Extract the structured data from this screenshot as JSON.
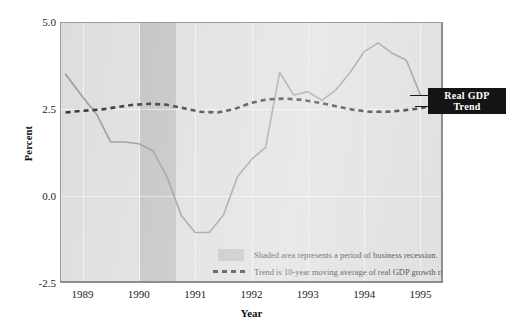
{
  "chart_data": {
    "type": "line",
    "title": "",
    "xlabel": "Year",
    "ylabel": "Percent",
    "xlim": [
      1988.6,
      1995.4
    ],
    "ylim": [
      -2.5,
      5.0
    ],
    "yticks": [
      "5.0",
      "2.5",
      "0.0",
      "-2.5"
    ],
    "ytick_values": [
      5.0,
      2.5,
      0.0,
      -2.5
    ],
    "xticks": [
      "1989",
      "1990",
      "1991",
      "1992",
      "1993",
      "1994",
      "1995"
    ],
    "xtick_values": [
      1989,
      1990,
      1991,
      1992,
      1993,
      1994,
      1995
    ],
    "grid": true,
    "legend_position": "inside-bottom-center",
    "series": [
      {
        "name": "Real GDP",
        "style": "solid",
        "color": "#8c8c8c",
        "x": [
          1988.7,
          1989.0,
          1989.25,
          1989.5,
          1989.75,
          1990.0,
          1990.25,
          1990.5,
          1990.75,
          1991.0,
          1991.25,
          1991.5,
          1991.75,
          1992.0,
          1992.25,
          1992.5,
          1992.75,
          1993.0,
          1993.25,
          1993.5,
          1993.75,
          1994.0,
          1994.25,
          1994.5,
          1994.75,
          1995.0
        ],
        "y": [
          3.5,
          2.85,
          2.35,
          1.55,
          1.55,
          1.5,
          1.3,
          0.55,
          -0.55,
          -1.05,
          -1.05,
          -0.55,
          0.55,
          1.05,
          1.4,
          3.55,
          2.9,
          3.0,
          2.75,
          3.05,
          3.55,
          4.15,
          4.4,
          4.1,
          3.9,
          2.9
        ]
      },
      {
        "name": "Trend",
        "style": "dashed",
        "color": "#1a1a1a",
        "description": "10-year moving average of real GDP growth rate",
        "x": [
          1988.7,
          1989.0,
          1989.3,
          1989.6,
          1989.9,
          1990.2,
          1990.5,
          1990.8,
          1991.1,
          1991.4,
          1991.7,
          1992.0,
          1992.3,
          1992.6,
          1992.9,
          1993.2,
          1993.5,
          1993.8,
          1994.1,
          1994.4,
          1994.7,
          1995.0,
          1995.15
        ],
        "y": [
          2.4,
          2.45,
          2.48,
          2.55,
          2.62,
          2.65,
          2.62,
          2.52,
          2.42,
          2.4,
          2.5,
          2.68,
          2.78,
          2.8,
          2.76,
          2.68,
          2.58,
          2.48,
          2.42,
          2.42,
          2.46,
          2.52,
          2.58
        ]
      }
    ],
    "shaded_regions": [
      {
        "label": "business recession",
        "x_start": 1990.02,
        "x_end": 1990.66,
        "color": "#b9b9b9"
      }
    ],
    "annotations": [
      {
        "name": "real-gdp-callout",
        "text": "Real GDP",
        "at_x": 1995.0,
        "at_y": 2.9
      },
      {
        "name": "trend-callout",
        "text": "Trend",
        "at_x": 1995.15,
        "at_y": 2.58
      }
    ]
  },
  "axes": {
    "y_title": "Percent",
    "x_title": "Year",
    "y_ticks": [
      {
        "label": "5.0"
      },
      {
        "label": "2.5"
      },
      {
        "label": "0.0"
      },
      {
        "label": "-2.5"
      }
    ],
    "x_ticks": [
      {
        "label": "1989"
      },
      {
        "label": "1990"
      },
      {
        "label": "1991"
      },
      {
        "label": "1992"
      },
      {
        "label": "1993"
      },
      {
        "label": "1994"
      },
      {
        "label": "1995"
      }
    ]
  },
  "legend": {
    "rows": [
      {
        "key": "shaded-swatch",
        "text": "Shaded area represents a period of business recession."
      },
      {
        "key": "dashed-swatch",
        "text": "Trend is 10-year moving average of real GDP growth rate."
      }
    ]
  },
  "callouts": {
    "real_gdp": "Real GDP",
    "trend": "Trend"
  },
  "colors": {
    "plot_background": "#d9d9d9",
    "recession_band": "#b9b9b9",
    "gdp_line": "#8c8c8c",
    "trend_line": "#1a1a1a",
    "callout_background": "#141414",
    "callout_text": "#ffffff",
    "page_background": "#ffffff"
  }
}
